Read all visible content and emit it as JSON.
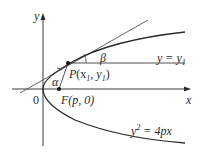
{
  "figure": {
    "type": "parabola-reflection-diagram",
    "axes": {
      "x_label": "x",
      "y_label": "y",
      "origin_label": "0"
    },
    "curve": {
      "equation_lhs": "y",
      "equation_exp": "2",
      "equation_rhs": " = 4px"
    },
    "focus": {
      "label_name": "F",
      "label_coords": "(p, 0)"
    },
    "point": {
      "label_name": "P",
      "label_open": "(x",
      "label_sub1": "1",
      "label_mid": ", y",
      "label_sub2": "1",
      "label_close": ")"
    },
    "horizontal_line": {
      "label_lhs": "y = y",
      "label_sub": "1"
    },
    "angles": {
      "alpha": "α",
      "beta": "β"
    },
    "colors": {
      "stroke": "#2a2a2a",
      "axis": "#3a3a3a",
      "tangent": "#555555"
    }
  }
}
